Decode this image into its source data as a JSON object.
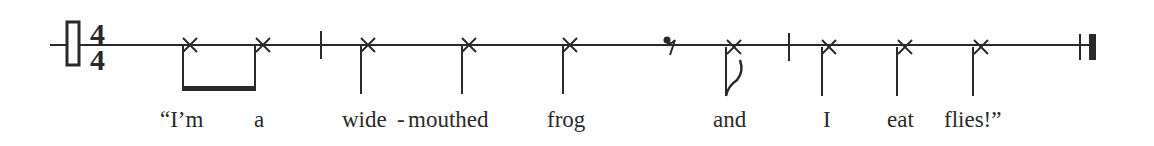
{
  "notation": {
    "clef": "percussion-clef",
    "time_signature": {
      "numerator": "4",
      "denominator": "4"
    },
    "ink_color": "#2a2a2a"
  },
  "lyrics": [
    {
      "text": "“I’m",
      "x": 160
    },
    {
      "text": "a",
      "x": 254
    },
    {
      "text": "wide",
      "x": 342
    },
    {
      "text": "-",
      "x": 397
    },
    {
      "text": "mouthed",
      "x": 408
    },
    {
      "text": "frog",
      "x": 547
    },
    {
      "text": "and",
      "x": 713
    },
    {
      "text": "I",
      "x": 823
    },
    {
      "text": "eat",
      "x": 887
    },
    {
      "text": "flies!”",
      "x": 944
    }
  ],
  "measures": [
    {
      "notes": [
        "eighth-beamed",
        "eighth-beamed"
      ]
    },
    {
      "notes": [
        "quarter",
        "quarter",
        "quarter",
        "eighth-rest",
        "eighth"
      ]
    },
    {
      "notes": [
        "quarter",
        "quarter",
        "quarter"
      ]
    }
  ]
}
